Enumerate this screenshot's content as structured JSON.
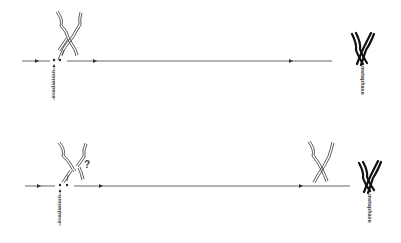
{
  "diagram": {
    "panels": [
      {
        "id": "top",
        "irradiation_label": "irradiation",
        "end_label": "metaphase",
        "question_mark": ""
      },
      {
        "id": "bottom",
        "irradiation_label": "irradiation",
        "end_label": "metaphase",
        "question_mark": "?"
      }
    ],
    "colors": {
      "line": "#555555",
      "chromosome": "#222222",
      "background": "#ffffff"
    }
  }
}
